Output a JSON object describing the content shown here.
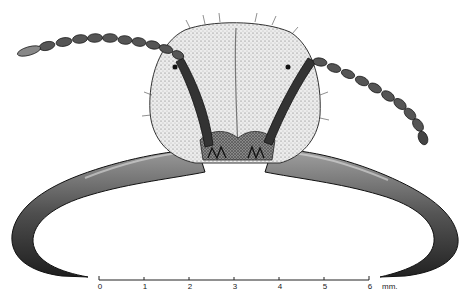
{
  "figure": {
    "style": "black-and-white stipple drawing",
    "colors": {
      "background": "#ffffff",
      "ink": "#1a1a1a",
      "head_fill": "#e6e6e6",
      "mandible_fill": "#5a5a5a",
      "antenna_fill": "#4a4a4a"
    }
  },
  "scale_bar": {
    "ticks": [
      "0",
      "1",
      "2",
      "3",
      "4",
      "5",
      "6"
    ],
    "unit": "mm."
  }
}
